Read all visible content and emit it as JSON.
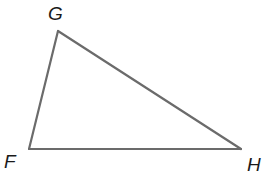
{
  "diagram": {
    "type": "triangle",
    "vertices": [
      {
        "id": "G",
        "label": "G"
      },
      {
        "id": "F",
        "label": "F"
      },
      {
        "id": "H",
        "label": "H"
      }
    ],
    "sides": [
      {
        "name": "GF",
        "from": "G",
        "to": "F"
      },
      {
        "name": "FH",
        "from": "F",
        "to": "H"
      },
      {
        "name": "HG",
        "from": "H",
        "to": "G"
      }
    ],
    "stroke_color": "#6b6b6b",
    "label_color": "#1a1a1a"
  }
}
